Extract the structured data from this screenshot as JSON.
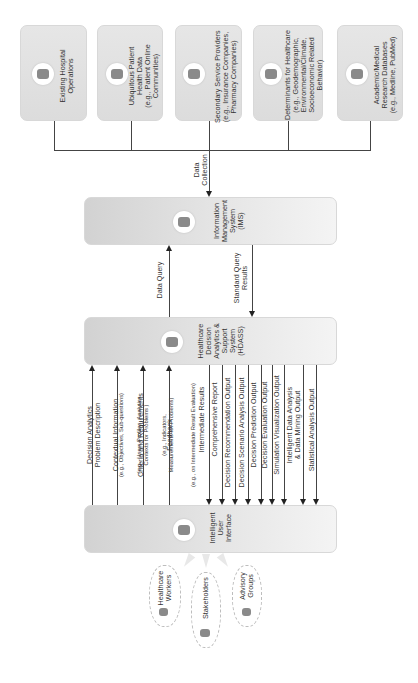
{
  "diagram": {
    "orientation": "rotated-90-ccw",
    "sources": [
      {
        "id": "hospital",
        "label": "Existing Hospital\nOperations",
        "icon": "building-icon"
      },
      {
        "id": "patient",
        "label": "Ubiquitous Patient\nHealth Data\n(e.g., Patient Online\nCommunities)",
        "icon": "patient-data-icon"
      },
      {
        "id": "secondary",
        "label": "Secondary Service Providers\n(e.g., Insurance Companies,\nPharmacy Companies)",
        "icon": "service-provider-icon"
      },
      {
        "id": "determinants",
        "label": "Determinants for Healthcare\n(e.g., Geodemographic,\nEnvironmental/Climate,\nSocioeconomic Related\nBehavior)",
        "icon": "globe-person-icon"
      },
      {
        "id": "academic",
        "label": "Academic/Medical\nResearch Databases\n(e.g., Medline, PubMed)",
        "icon": "books-icon"
      }
    ],
    "data_collection_label": "Data\nCollection",
    "ims": {
      "label": "Information\nManagement\nSystem\n(IMS)",
      "icon": "database-server-icon"
    },
    "data_query_label": "Data Query",
    "standard_query_label": "Standard Query\nResults",
    "hdass": {
      "label": "Healthcare\nDecision\nAnalytics &\nSupport\nSystem\n(HDASS)",
      "icon": "analytics-icon"
    },
    "inputs_to_hdass": [
      {
        "title": "Decision Analytics\nProblem Description",
        "detail": "(e.g., Objectives, Sub-questions)"
      },
      {
        "title": "Contextual Information",
        "detail": "(e.g., Users Profiles, Analytics\nContexts for Problems )"
      },
      {
        "title": "Criteria and Requirements",
        "detail": "(e.g., Indicators,\nMeasurements for Problems)"
      },
      {
        "title": "Feedback",
        "detail": "(e.g., on Intermediate Result Evaluation)"
      }
    ],
    "outputs_to_ui": [
      "Intermediate Results",
      "Comprehensive Report",
      "Decision Recommendation Output",
      "Decision Scenario Analysis Output",
      "Decision Prediction Output",
      "Decision Evaluation Output",
      "Simulation Visualization Output",
      "Intelligent Data Analysis\n& Data Mining Output",
      "Statistical Analysis Output"
    ],
    "ui": {
      "label": "Intelligent\nUser\nInterface",
      "icon": "users-group-icon"
    },
    "user_groups": [
      {
        "label": "Healthcare\nWorkers",
        "icon": "healthcare-worker-icon"
      },
      {
        "label": "Stakeholders",
        "icon": "stakeholders-icon"
      },
      {
        "label": "Advisory\nGroups",
        "icon": "advisory-group-icon"
      }
    ]
  }
}
